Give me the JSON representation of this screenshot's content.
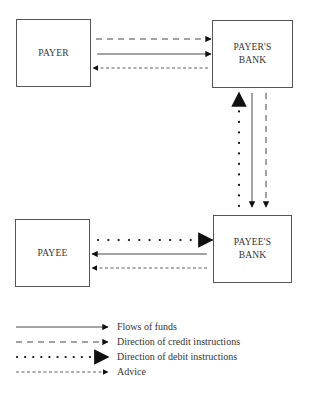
{
  "nodes": {
    "payer": {
      "label": "PAYER"
    },
    "payers_bank": {
      "line1": "PAYER'S",
      "line2": "BANK"
    },
    "payee": {
      "label": "PAYEE"
    },
    "payees_bank": {
      "line1": "PAYEE'S",
      "line2": "BANK"
    }
  },
  "edges": [
    {
      "from": "payer",
      "to": "payers_bank",
      "type": "credit_instructions"
    },
    {
      "from": "payer",
      "to": "payers_bank",
      "type": "flows_of_funds"
    },
    {
      "from": "payers_bank",
      "to": "payer",
      "type": "advice"
    },
    {
      "from": "payees_bank",
      "to": "payers_bank",
      "type": "debit_instructions"
    },
    {
      "from": "payers_bank",
      "to": "payees_bank",
      "type": "flows_of_funds"
    },
    {
      "from": "payers_bank",
      "to": "payees_bank",
      "type": "credit_instructions"
    },
    {
      "from": "payee",
      "to": "payees_bank",
      "type": "debit_instructions"
    },
    {
      "from": "payees_bank",
      "to": "payee",
      "type": "flows_of_funds"
    },
    {
      "from": "payees_bank",
      "to": "payee",
      "type": "advice"
    }
  ],
  "legend": {
    "items": [
      {
        "style": "solid",
        "label": "Flows of funds"
      },
      {
        "style": "dashed",
        "label": "Direction of credit instructions"
      },
      {
        "style": "dotted",
        "label": "Direction of debit instructions"
      },
      {
        "style": "fine-dashed",
        "label": "Advice"
      }
    ]
  },
  "colors": {
    "line": "#222222",
    "box_border": "#555555",
    "background": "#ffffff"
  }
}
